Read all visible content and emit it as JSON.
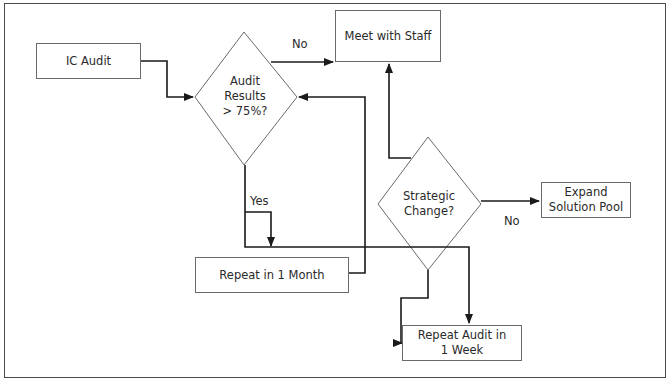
{
  "diagram": {
    "type": "flowchart",
    "nodes": {
      "ic_audit": {
        "label": "IC Audit",
        "shape": "rect"
      },
      "audit_results": {
        "label_lines": [
          "Audit",
          "Results",
          "> 75%?"
        ],
        "shape": "diamond"
      },
      "meet_staff": {
        "label": "Meet with Staff",
        "shape": "rect"
      },
      "strategic_change": {
        "label_lines": [
          "Strategic",
          "Change?"
        ],
        "shape": "diamond"
      },
      "expand_pool": {
        "label_lines": [
          "Expand",
          "Solution Pool"
        ],
        "shape": "rect"
      },
      "repeat_month": {
        "label": "Repeat in 1 Month",
        "shape": "rect"
      },
      "repeat_week": {
        "label_lines": [
          "Repeat Audit in",
          "1 Week"
        ],
        "shape": "rect"
      }
    },
    "edges": [
      {
        "from": "ic_audit",
        "to": "audit_results",
        "label": ""
      },
      {
        "from": "audit_results",
        "to": "meet_staff",
        "label": "No"
      },
      {
        "from": "audit_results",
        "to": "repeat_month",
        "label": "Yes"
      },
      {
        "from": "audit_results",
        "to": "repeat_week",
        "label": ""
      },
      {
        "from": "repeat_month",
        "to": "audit_results",
        "label": ""
      },
      {
        "from": "strategic_change",
        "to": "meet_staff",
        "label": ""
      },
      {
        "from": "strategic_change",
        "to": "expand_pool",
        "label": "No"
      },
      {
        "from": "strategic_change",
        "to": "repeat_week",
        "label": ""
      }
    ],
    "edge_labels": {
      "no_top": "No",
      "yes": "Yes",
      "no_right": "No"
    },
    "colors": {
      "line": "#1a1a1a",
      "shape_border": "#6a6a6a",
      "text": "#2a2a2a",
      "background": "#ffffff"
    }
  }
}
